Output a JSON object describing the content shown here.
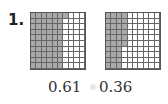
{
  "problem": {
    "number": "1.",
    "grids": [
      {
        "rows": 10,
        "cols": 10,
        "shaded": 61,
        "fill_order": "column-major",
        "shade_color": "#a9a9a9"
      },
      {
        "rows": 10,
        "cols": 10,
        "shaded": 36,
        "fill_order": "column-major",
        "shade_color": "#a9a9a9"
      }
    ],
    "labels": [
      "0.61",
      "0.36"
    ]
  }
}
